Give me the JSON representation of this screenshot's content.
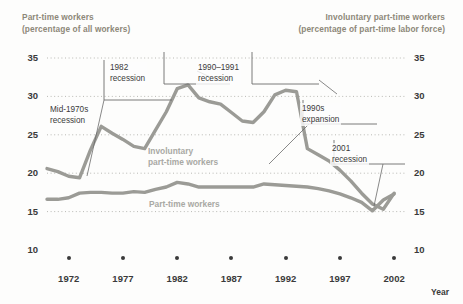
{
  "header": {
    "left": "Part-time workers\n(percentage of all workers)",
    "right": "Involuntary part-time workers\n(percentage of part-time labor force)"
  },
  "axis": {
    "x_title": "Year",
    "y_ticks": [
      "35",
      "30",
      "25",
      "20",
      "15",
      "10"
    ],
    "x_ticks": [
      "1972",
      "1977",
      "1982",
      "1987",
      "1992",
      "1997",
      "2002"
    ]
  },
  "series_labels": {
    "involuntary": "Involuntary\npart-time workers",
    "parttime": "Part-time workers"
  },
  "annotations": [
    {
      "id": "mid-1970s-recession",
      "text": "Mid-1970s\nrecession"
    },
    {
      "id": "1982-recession",
      "text": "1982\nrecession"
    },
    {
      "id": "1990-1991-recession",
      "text": "1990–1991\nrecession"
    },
    {
      "id": "1990s-expansion",
      "text": "1990s\nexpansion"
    },
    {
      "id": "2001-recession",
      "text": "2001\nrecession"
    }
  ],
  "colors": {
    "line": "#9b9b96",
    "header_text": "#8d8879",
    "tick_text": "#3a3a3a",
    "grid": "#b9b9b4",
    "background": "#fdfdfc"
  },
  "chart_data": {
    "type": "line",
    "title": "",
    "xlabel": "Year",
    "ylabel": "",
    "xlim": [
      1970,
      2003
    ],
    "ylim": [
      10,
      35
    ],
    "grid": true,
    "gridlines_y": [
      35,
      30,
      25,
      20,
      15
    ],
    "legend": "inline-labels",
    "x": [
      1970,
      1971,
      1972,
      1973,
      1974,
      1975,
      1976,
      1977,
      1978,
      1979,
      1980,
      1981,
      1982,
      1983,
      1984,
      1985,
      1986,
      1987,
      1988,
      1989,
      1990,
      1991,
      1992,
      1993,
      1994,
      1995,
      1996,
      1997,
      1998,
      1999,
      2000,
      2001,
      2002
    ],
    "series": [
      {
        "name": "Involuntary part-time workers",
        "unit": "percentage of part-time labor force",
        "values": [
          20.6,
          20.2,
          19.6,
          19.4,
          23.0,
          26.1,
          25.2,
          24.4,
          23.5,
          23.2,
          25.6,
          28.0,
          31.0,
          31.5,
          29.8,
          29.3,
          29.0,
          27.9,
          26.8,
          26.6,
          28.0,
          30.2,
          30.8,
          30.6,
          23.2,
          22.4,
          21.6,
          20.4,
          19.0,
          17.4,
          16.0,
          15.3,
          17.4
        ]
      },
      {
        "name": "Part-time workers",
        "unit": "percentage of all workers",
        "values": [
          16.6,
          16.6,
          16.8,
          17.4,
          17.5,
          17.5,
          17.4,
          17.4,
          17.6,
          17.5,
          17.9,
          18.2,
          18.8,
          18.6,
          18.2,
          18.2,
          18.2,
          18.2,
          18.2,
          18.2,
          18.6,
          18.5,
          18.4,
          18.3,
          18.2,
          18.0,
          17.7,
          17.3,
          16.8,
          16.2,
          15.1,
          16.5,
          17.3
        ]
      }
    ]
  }
}
